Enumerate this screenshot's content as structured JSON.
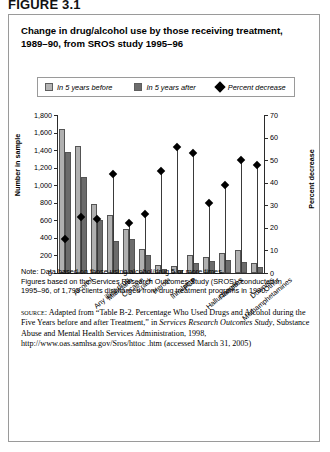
{
  "figure_number": "FIGURE 3.1",
  "title": {
    "line1": "Change in drug/alcohol use by those receiving treatment,",
    "line2": "1989–90, from SROS study 1995–96"
  },
  "legend": {
    "before_label": "In 5 years before",
    "after_label": "In 5 years after",
    "percent_label": "Percent decrease"
  },
  "axes": {
    "left_title": "Number in sample",
    "right_title": "Percent decrease",
    "left_ticks": [
      "1,800",
      "1,600",
      "1,400",
      "1,200",
      "1,000",
      "800",
      "600",
      "400",
      "200",
      "0"
    ],
    "right_ticks": [
      "70",
      "60",
      "50",
      "40",
      "30",
      "20",
      "10",
      "0"
    ]
  },
  "colors": {
    "before_bar": "#b0b0b0",
    "after_bar": "#6b6b6b",
    "marker": "#000000",
    "axis": "#2b2b2b",
    "panel_border": "#9a9a9a"
  },
  "notes": {
    "line1": "Note: Data based on those using alcohol/drug 5 or more times.",
    "line2": "Figures based on the Services Research Outcomes Study (SROS), conducted in",
    "line3": "1995–96, of 1,799 clients discharged from drug treatment programs in 1990."
  },
  "source": {
    "label": "source:",
    "text_1": " Adapted from “Table B-2. Percentage Who Used Drugs and Alcohol during the Five Years before and after Treatment,” in ",
    "italic_1": "Services Research Outcomes Study",
    "text_2": ", Substance Abuse and Mental Health Services Administration, 1998, http://www.oas.samhsa.gov/Sros/httoc .htm (accessed March 31, 2005)"
  },
  "chart_data": {
    "type": "bar",
    "title": "Change in drug/alcohol use by those receiving treatment, 1989–90, from SROS study 1995–96",
    "xlabel": "",
    "ylabel": "Number in sample",
    "y2label": "Percent decrease",
    "ylim": [
      0,
      1800
    ],
    "y2lim": [
      0,
      70
    ],
    "grid": false,
    "legend_position": "top",
    "categories": [
      "Alcohol",
      "Any illicit drug",
      "Marijuana",
      "Cocaine",
      "Crack",
      "Heroin",
      "Inhalants",
      "PCP",
      "Hallucinogens",
      "Narcotics",
      "Methamphetamines",
      "Downers",
      "Other"
    ],
    "series": [
      {
        "name": "In 5 years before",
        "axis": "left",
        "values": [
          1640,
          1450,
          790,
          660,
          500,
          270,
          90,
          80,
          210,
          180,
          230,
          260,
          110
        ]
      },
      {
        "name": "In 5 years after",
        "axis": "left",
        "values": [
          1380,
          1090,
          600,
          370,
          390,
          200,
          50,
          40,
          110,
          140,
          150,
          130,
          70
        ]
      },
      {
        "name": "Percent decrease",
        "axis": "right",
        "type": "scatter",
        "values": [
          15,
          25,
          24,
          44,
          22,
          26,
          45,
          56,
          53,
          31,
          39,
          50,
          48
        ]
      }
    ]
  }
}
